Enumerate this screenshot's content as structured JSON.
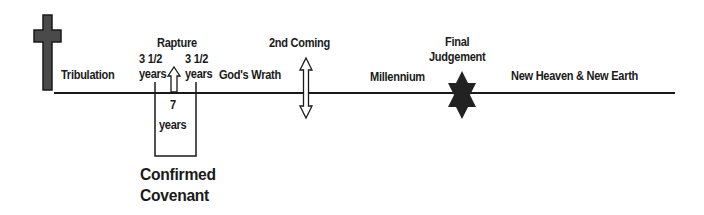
{
  "diagram": {
    "labels": {
      "tribulation": "Tribulation",
      "rapture": "Rapture",
      "half_left_num": "3 1/2",
      "half_left_unit": "years",
      "half_right_num": "3 1/2",
      "half_right_unit": "years",
      "seven_num": "7",
      "seven_unit": "years",
      "gods_wrath": "God's Wrath",
      "second_coming": "2nd Coming",
      "millennium": "Millennium",
      "final_line1": "Final",
      "final_line2": "Judgement",
      "new_heaven": "New Heaven & New Earth",
      "covenant_line1": "Confirmed",
      "covenant_line2": "Covenant"
    },
    "icons": {
      "cross": "cross-icon",
      "rapture_arrow": "up-arrow-icon",
      "second_coming_arrow": "double-arrow-icon",
      "final_judgement": "six-pointed-star-icon"
    },
    "colors": {
      "line": "#1a1a1a",
      "cross_fill": "#4a4a4a",
      "star_fill": "#222222",
      "background": "#ffffff"
    }
  }
}
